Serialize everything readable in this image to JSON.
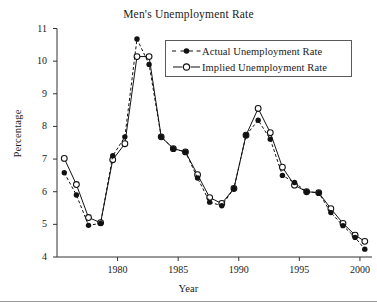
{
  "chart_data": {
    "type": "line",
    "title": "Men's Unemployment Rate",
    "xlabel": "Year",
    "ylabel": "Percentage",
    "xlim": [
      1975.0,
      2000.5
    ],
    "ylim": [
      4,
      11
    ],
    "xticks": [
      1980,
      1985,
      1990,
      1995,
      2000
    ],
    "xtick_labels": [
      "1980",
      "1985",
      "1990",
      "1995",
      "2000"
    ],
    "yticks": [
      4,
      5,
      6,
      7,
      8,
      9,
      10,
      11
    ],
    "ytick_labels": [
      "4",
      "5",
      "6",
      "7",
      "8",
      "9",
      "10",
      "11"
    ],
    "grid": false,
    "legend_position": "upper right",
    "x": [
      1975.6,
      1976.6,
      1977.6,
      1978.6,
      1979.6,
      1980.6,
      1981.6,
      1982.6,
      1983.6,
      1984.6,
      1985.6,
      1986.6,
      1987.6,
      1988.6,
      1989.6,
      1990.6,
      1991.6,
      1992.6,
      1993.6,
      1994.6,
      1995.6,
      1996.6,
      1997.6,
      1998.6,
      1999.6,
      2000.4
    ],
    "series": [
      {
        "name": "Actual Unemployment Rate",
        "marker": "filled-circle",
        "linestyle": "dashed",
        "color": "#111111",
        "values": [
          6.58,
          5.9,
          4.97,
          5.03,
          7.1,
          7.68,
          10.68,
          9.9,
          7.68,
          7.32,
          7.22,
          6.42,
          5.68,
          5.57,
          6.1,
          7.73,
          8.19,
          7.61,
          6.5,
          6.28,
          6.0,
          5.97,
          5.36,
          4.96,
          4.6,
          4.24
        ]
      },
      {
        "name": "Implied Unemployment Rate",
        "marker": "open-circle",
        "linestyle": "solid",
        "color": "#111111",
        "values": [
          7.02,
          6.22,
          5.21,
          5.05,
          6.98,
          7.47,
          10.14,
          10.14,
          7.68,
          7.32,
          7.22,
          6.52,
          5.82,
          5.64,
          6.1,
          7.73,
          8.55,
          7.81,
          6.75,
          6.2,
          6.0,
          5.97,
          5.48,
          5.03,
          4.67,
          4.48
        ]
      }
    ]
  },
  "legend": {
    "entries": [
      {
        "label": "Actual Unemployment Rate"
      },
      {
        "label": "Implied Unemployment Rate"
      }
    ]
  }
}
